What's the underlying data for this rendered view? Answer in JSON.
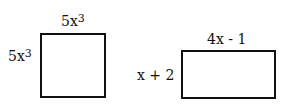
{
  "figures": [
    {
      "name": "square",
      "top_label": {
        "base": "5x",
        "exp": "3"
      },
      "side_label": {
        "base": "5x",
        "exp": "3"
      }
    },
    {
      "name": "rectangle",
      "top_label": "4x - 1",
      "side_label": "x + 2"
    }
  ]
}
